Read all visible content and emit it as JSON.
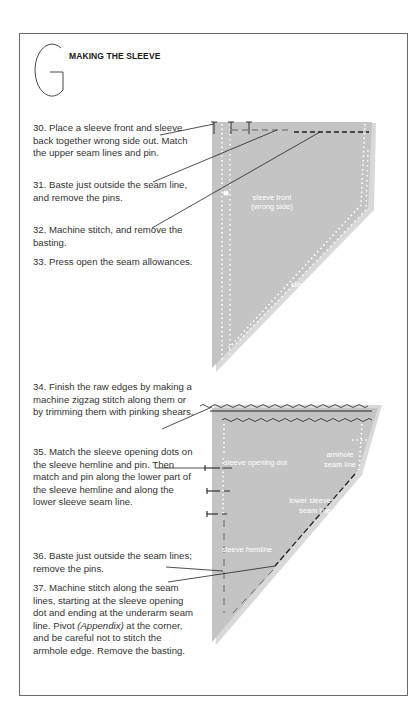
{
  "section": {
    "letter": "G",
    "title": "MAKING THE SLEEVE"
  },
  "steps": [
    {
      "number": "30",
      "text": "30. Place a sleeve front and sleeve back together wrong side out. Match the upper seam lines and pin."
    },
    {
      "number": "31",
      "text": "31. Baste just outside the seam line, and remove the pins."
    },
    {
      "number": "32",
      "text": "32. Machine stitch, and remove the basting."
    },
    {
      "number": "33",
      "text": "33. Press open the seam allowances."
    },
    {
      "number": "34",
      "text": "34. Finish the raw edges by making a machine zigzag stitch along them or by trimming them with pinking shears."
    },
    {
      "number": "35",
      "text": "35. Match the sleeve opening dots on the sleeve hemline and pin. Then match and pin along the lower part of the sleeve hemline and along the lower sleeve seam line."
    },
    {
      "number": "36",
      "text": "36. Baste just outside the seam lines; remove the pins."
    },
    {
      "number": "37",
      "text_before": "37. Machine stitch along the seam lines, starting at the sleeve opening dot and ending at the underarm seam line. Pivot ",
      "text_italic": "(Appendix)",
      "text_after": " at the corner, and be careful not to stitch the armhole edge. Remove the basting."
    }
  ],
  "diagram1": {
    "labels": {
      "sleeve_front_line1": "sleeve front",
      "sleeve_front_line2": "(wrong side)",
      "sleeve_back": "sleeve back"
    }
  },
  "diagram2": {
    "labels": {
      "sleeve_opening_dot": "sleeve opening dot",
      "armhole_line1": "armhole",
      "armhole_line2": "seam line",
      "lower_sleeve_line1": "lower sleeve",
      "lower_sleeve_line2": "seam line",
      "sleeve_hemline": "sleeve hemline"
    }
  },
  "colors": {
    "fabric": "#c4c4c4",
    "fabric_shadow": "#d9d9d9",
    "border": "#6a6a6a",
    "text": "#333333"
  }
}
